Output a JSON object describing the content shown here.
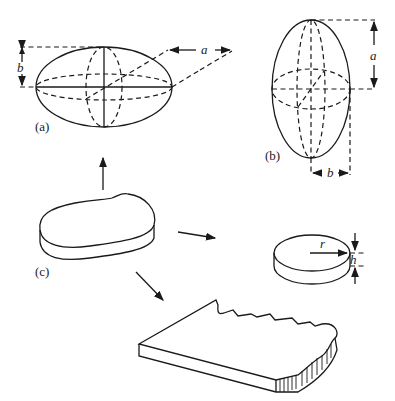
{
  "figure": {
    "panels": [
      {
        "id": "a",
        "label": "(a)",
        "shape": "prolate spheroid (horizontal)",
        "dimensions": [
          {
            "symbol": "a",
            "meaning": "semi-major axis"
          },
          {
            "symbol": "b",
            "meaning": "semi-minor axis"
          }
        ]
      },
      {
        "id": "b",
        "label": "(b)",
        "shape": "prolate spheroid (vertical)",
        "dimensions": [
          {
            "symbol": "a",
            "meaning": "semi-major axis"
          },
          {
            "symbol": "b",
            "meaning": "semi-minor axis"
          }
        ]
      },
      {
        "id": "c",
        "label": "(c)",
        "shape": "irregular flat particle (source)"
      },
      {
        "id": "disk",
        "label": "",
        "shape": "cylindrical disk",
        "dimensions": [
          {
            "symbol": "r",
            "meaning": "radius"
          },
          {
            "symbol": "h",
            "meaning": "height"
          }
        ]
      },
      {
        "id": "plate",
        "label": "",
        "shape": "irregular plate slab"
      }
    ],
    "labels": {
      "panel_a": "(a)",
      "panel_b": "(b)",
      "panel_c": "(c)",
      "dim_a_top": "a",
      "dim_b_top": "b",
      "dim_a_right": "a",
      "dim_b_right": "b",
      "dim_r": "r",
      "dim_h": "h"
    },
    "arrows": [
      {
        "from": "c",
        "to": "a",
        "direction": "up"
      },
      {
        "from": "c",
        "to": "disk",
        "direction": "right"
      },
      {
        "from": "c",
        "to": "plate",
        "direction": "down-right"
      }
    ]
  }
}
